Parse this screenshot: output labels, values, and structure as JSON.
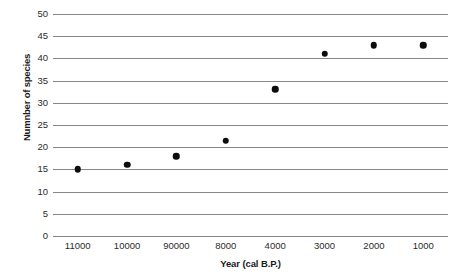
{
  "chart_data": {
    "type": "scatter",
    "title": "",
    "xlabel": "Year (cal B.P.)",
    "ylabel": "Numnber of species",
    "categories": [
      "11000",
      "10000",
      "90000",
      "8000",
      "4000",
      "3000",
      "2000",
      "1000"
    ],
    "values": [
      15,
      16,
      18,
      21.5,
      33,
      41,
      43,
      43
    ],
    "series": [
      {
        "name": "Number of species",
        "values": [
          15,
          16,
          18,
          21.5,
          33,
          41,
          43,
          43
        ],
        "marker_color": "#0d0d0d"
      }
    ],
    "ylim": [
      0,
      50
    ],
    "ytick_labels": [
      "0",
      "5",
      "10",
      "15",
      "20",
      "25",
      "30",
      "35",
      "40",
      "45",
      "50"
    ],
    "ytick_values": [
      0,
      5,
      10,
      15,
      20,
      25,
      30,
      35,
      40,
      45,
      50
    ],
    "grid": "horizontal",
    "legend": "none",
    "gridline_color": "#868686",
    "background_color": "#ffffff"
  },
  "watermarks": [
    "",
    "",
    ""
  ]
}
